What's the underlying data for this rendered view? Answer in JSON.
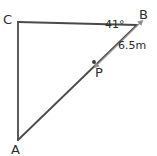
{
  "figure": {
    "type": "geometry-diagram",
    "background_color": "#ffffff",
    "stroke_color": "#4a4a4a",
    "measure_stroke_color": "#9a9a9a",
    "text_color": "#2b2b2b"
  },
  "vertices": [
    {
      "id": "C",
      "label": "C",
      "x": 18,
      "y": 22
    },
    {
      "id": "B",
      "label": "B",
      "x": 137,
      "y": 25
    },
    {
      "id": "A",
      "label": "A",
      "x": 18,
      "y": 140
    },
    {
      "id": "P",
      "label": "P",
      "x": 94,
      "y": 62
    }
  ],
  "segments": [
    {
      "id": "CB",
      "from": "C",
      "to": "B",
      "style": "solid"
    },
    {
      "id": "CA",
      "from": "C",
      "to": "A",
      "style": "solid"
    },
    {
      "id": "AB",
      "from": "A",
      "to": "B",
      "style": "solid"
    }
  ],
  "measures": [
    {
      "id": "PB",
      "label": "6.5m",
      "value": 6.5,
      "unit": "m",
      "from": "P",
      "to": "B",
      "arrow": "double"
    }
  ],
  "angles": [
    {
      "id": "angle-B",
      "label": "41°",
      "value": 41,
      "unit": "degrees",
      "at": "B",
      "between": [
        "BC",
        "BA"
      ]
    }
  ],
  "labels": {
    "C": "C",
    "B": "B",
    "A": "A",
    "P": "P",
    "angle_b": "41°",
    "distance_pb": "6.5m"
  }
}
